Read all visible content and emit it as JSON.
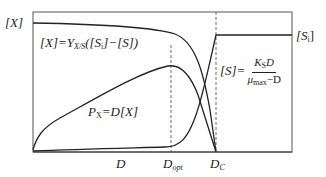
{
  "diagram": {
    "type": "chemostat steady-state diagram",
    "axes": {
      "y_label_left": "[X]",
      "y_label_right": "[Si]",
      "x_ticks": [
        "D",
        "Dopt",
        "DC"
      ]
    },
    "labels": {
      "y_left": "[X]",
      "y_right_main": "[S",
      "y_right_sub": "i",
      "y_right_close": "]",
      "biomass_eq": {
        "lhs": "[X]=Y",
        "sub": "X/S",
        "rhs": "([S",
        "sub2": "i",
        "rhs2": "]−[S])"
      },
      "productivity_eq": {
        "p": "P",
        "sub": "X",
        "rhs": "=D[X]"
      },
      "substrate_eq": {
        "lhs": "[S]=",
        "num": "K",
        "num_sub": "S",
        "num_tail": "D",
        "den": "μ",
        "den_sub": "max",
        "den_tail": "−D"
      },
      "x_tick_d": "D",
      "x_tick_dopt": "D",
      "x_tick_dopt_sub": "opt",
      "x_tick_dc": "D",
      "x_tick_dc_sub": "C"
    },
    "curves": [
      {
        "name": "biomass [X]",
        "description": "near-flat high then falls steeply to zero at D_C"
      },
      {
        "name": "productivity P_X",
        "description": "rises to max at D_opt then falls to zero at D_C"
      },
      {
        "name": "substrate [S]",
        "description": "near zero, rises sharply near D_C then plateaus at [Si]"
      }
    ],
    "colors": {
      "line": "#222222",
      "frame": "#555555",
      "background": "#ffffff"
    }
  }
}
